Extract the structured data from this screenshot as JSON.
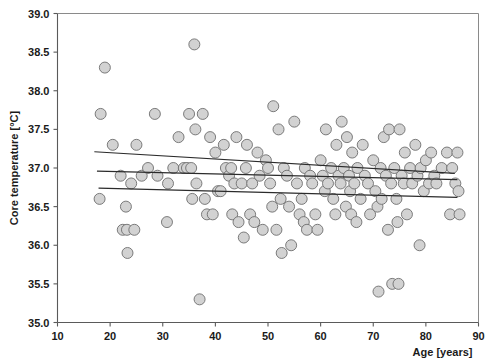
{
  "chart_data": {
    "type": "scatter",
    "title": "",
    "xlabel": "Age [years]",
    "ylabel": "Core temperature [°C]",
    "xlim": [
      10,
      90
    ],
    "ylim": [
      35.0,
      39.0
    ],
    "xticks": [
      10,
      20,
      30,
      40,
      50,
      60,
      70,
      80,
      90
    ],
    "xtick_labels": [
      "10",
      "20",
      "30",
      "40",
      "50",
      "60",
      "70",
      "80",
      "90"
    ],
    "yticks": [
      35.0,
      35.5,
      36.0,
      36.5,
      37.0,
      37.5,
      38.0,
      38.5,
      39.0
    ],
    "ytick_labels": [
      "35.0",
      "35.5",
      "36.0",
      "36.5",
      "37.0",
      "37.5",
      "38.0",
      "38.5",
      "39.0"
    ],
    "grid": false,
    "legend": false,
    "marker": {
      "shape": "circle",
      "size_px": 11,
      "fill": "#d2d2d2",
      "edge": "#6e6e6e"
    },
    "series": [
      {
        "name": "Core temperature vs age",
        "points": [
          [
            18.0,
            36.6
          ],
          [
            18.2,
            37.7
          ],
          [
            19.0,
            38.3
          ],
          [
            20.5,
            37.3
          ],
          [
            22.0,
            36.9
          ],
          [
            22.4,
            36.2
          ],
          [
            23.0,
            36.5
          ],
          [
            23.2,
            36.2
          ],
          [
            23.3,
            35.9
          ],
          [
            24.0,
            36.8
          ],
          [
            24.6,
            36.2
          ],
          [
            25.0,
            37.3
          ],
          [
            26.0,
            36.9
          ],
          [
            27.2,
            37.0
          ],
          [
            28.5,
            37.7
          ],
          [
            29.0,
            36.9
          ],
          [
            30.8,
            36.3
          ],
          [
            31.0,
            36.8
          ],
          [
            32.0,
            37.0
          ],
          [
            33.0,
            37.4
          ],
          [
            34.0,
            37.0
          ],
          [
            34.6,
            37.0
          ],
          [
            35.0,
            37.7
          ],
          [
            35.4,
            37.0
          ],
          [
            35.6,
            36.6
          ],
          [
            36.0,
            38.6
          ],
          [
            36.2,
            37.5
          ],
          [
            36.4,
            36.8
          ],
          [
            37.0,
            35.3
          ],
          [
            37.6,
            37.7
          ],
          [
            38.0,
            36.6
          ],
          [
            38.4,
            36.4
          ],
          [
            39.0,
            37.4
          ],
          [
            39.5,
            36.4
          ],
          [
            40.0,
            37.2
          ],
          [
            40.5,
            36.7
          ],
          [
            41.0,
            36.7
          ],
          [
            41.6,
            37.3
          ],
          [
            42.0,
            37.0
          ],
          [
            42.6,
            36.9
          ],
          [
            43.0,
            37.0
          ],
          [
            43.2,
            36.4
          ],
          [
            43.6,
            36.8
          ],
          [
            44.0,
            37.4
          ],
          [
            44.4,
            36.3
          ],
          [
            45.0,
            36.8
          ],
          [
            45.4,
            36.1
          ],
          [
            45.8,
            37.0
          ],
          [
            46.0,
            37.3
          ],
          [
            46.6,
            36.4
          ],
          [
            47.0,
            36.8
          ],
          [
            47.4,
            36.3
          ],
          [
            48.0,
            37.2
          ],
          [
            48.4,
            36.9
          ],
          [
            49.0,
            36.2
          ],
          [
            49.6,
            37.1
          ],
          [
            50.0,
            37.0
          ],
          [
            50.4,
            36.8
          ],
          [
            50.8,
            36.5
          ],
          [
            51.0,
            37.8
          ],
          [
            51.6,
            36.2
          ],
          [
            52.0,
            37.5
          ],
          [
            52.4,
            36.6
          ],
          [
            52.6,
            35.9
          ],
          [
            53.0,
            37.0
          ],
          [
            53.6,
            36.9
          ],
          [
            54.0,
            36.5
          ],
          [
            54.4,
            36.0
          ],
          [
            55.0,
            37.6
          ],
          [
            55.5,
            36.8
          ],
          [
            56.0,
            36.4
          ],
          [
            56.4,
            36.6
          ],
          [
            56.8,
            36.3
          ],
          [
            57.0,
            37.0
          ],
          [
            57.4,
            36.2
          ],
          [
            58.0,
            36.9
          ],
          [
            58.4,
            36.8
          ],
          [
            59.0,
            36.4
          ],
          [
            59.4,
            36.2
          ],
          [
            60.0,
            37.1
          ],
          [
            60.4,
            36.9
          ],
          [
            60.8,
            36.7
          ],
          [
            61.0,
            37.5
          ],
          [
            61.4,
            36.8
          ],
          [
            62.0,
            37.0
          ],
          [
            62.4,
            36.6
          ],
          [
            62.8,
            36.4
          ],
          [
            63.0,
            37.3
          ],
          [
            63.4,
            36.9
          ],
          [
            63.8,
            36.8
          ],
          [
            64.0,
            37.6
          ],
          [
            64.4,
            37.0
          ],
          [
            64.8,
            36.5
          ],
          [
            65.0,
            37.4
          ],
          [
            65.4,
            36.9
          ],
          [
            65.6,
            36.7
          ],
          [
            65.8,
            36.4
          ],
          [
            66.0,
            37.2
          ],
          [
            66.4,
            36.8
          ],
          [
            66.8,
            36.3
          ],
          [
            67.0,
            37.0
          ],
          [
            67.6,
            36.6
          ],
          [
            68.0,
            37.3
          ],
          [
            68.4,
            36.9
          ],
          [
            69.0,
            36.8
          ],
          [
            69.4,
            36.4
          ],
          [
            70.0,
            37.1
          ],
          [
            70.4,
            36.7
          ],
          [
            70.8,
            36.5
          ],
          [
            71.0,
            35.4
          ],
          [
            71.4,
            37.0
          ],
          [
            71.6,
            36.6
          ],
          [
            72.0,
            37.4
          ],
          [
            72.4,
            36.9
          ],
          [
            72.8,
            36.2
          ],
          [
            73.0,
            37.5
          ],
          [
            73.4,
            36.8
          ],
          [
            73.6,
            35.5
          ],
          [
            74.0,
            37.0
          ],
          [
            74.4,
            36.6
          ],
          [
            74.6,
            36.3
          ],
          [
            74.8,
            35.5
          ],
          [
            75.0,
            37.5
          ],
          [
            75.4,
            36.9
          ],
          [
            75.8,
            36.8
          ],
          [
            76.0,
            37.2
          ],
          [
            76.4,
            36.4
          ],
          [
            77.0,
            37.0
          ],
          [
            77.4,
            36.8
          ],
          [
            78.0,
            37.3
          ],
          [
            78.4,
            36.9
          ],
          [
            78.8,
            36.0
          ],
          [
            79.0,
            37.0
          ],
          [
            79.6,
            36.7
          ],
          [
            80.0,
            37.1
          ],
          [
            80.6,
            36.8
          ],
          [
            81.0,
            37.2
          ],
          [
            81.6,
            36.9
          ],
          [
            82.0,
            36.8
          ],
          [
            83.0,
            37.0
          ],
          [
            84.0,
            37.2
          ],
          [
            84.6,
            36.4
          ],
          [
            85.0,
            37.0
          ],
          [
            85.6,
            36.8
          ],
          [
            86.0,
            37.2
          ],
          [
            86.2,
            36.7
          ],
          [
            86.4,
            36.4
          ]
        ]
      }
    ],
    "fit_lines": [
      {
        "name": "upper-confidence-line",
        "x": [
          17.0,
          85.5
        ],
        "y": [
          37.21,
          36.93
        ]
      },
      {
        "name": "regression-line",
        "x": [
          17.5,
          86.0
        ],
        "y": [
          36.96,
          36.85
        ]
      },
      {
        "name": "lower-confidence-line",
        "x": [
          17.8,
          86.0
        ],
        "y": [
          36.74,
          36.62
        ]
      }
    ]
  },
  "axes": {
    "x_title": "Age [years]",
    "y_title": "Core temperature [°C]"
  }
}
